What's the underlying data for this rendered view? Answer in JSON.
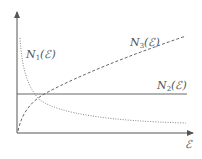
{
  "figure": {
    "x_axis_label": "ℰ",
    "curves": [
      {
        "id": "N1",
        "label_main": "N",
        "label_sub": "1",
        "label_arg": "(ℰ)",
        "style": "dotted",
        "shape": "decreasing hyperbola-like, asymptotic to low constant"
      },
      {
        "id": "N2",
        "label_main": "N",
        "label_sub": "2",
        "label_arg": "(ℰ)",
        "style": "solid",
        "shape": "horizontal constant"
      },
      {
        "id": "N3",
        "label_main": "N",
        "label_sub": "3",
        "label_arg": "(ℰ)",
        "style": "dashed",
        "shape": "increasing concave (square-root-like)"
      }
    ]
  },
  "colors": {
    "axis": "#555555",
    "curve": "#666666",
    "text": "#555555"
  }
}
